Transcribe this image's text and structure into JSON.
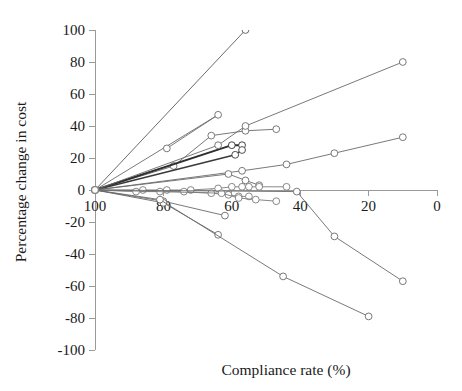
{
  "chart_data": {
    "type": "line",
    "title": "",
    "xlabel": "Compliance rate (%)",
    "ylabel": "Percentage change in cost",
    "xlim": [
      100,
      0
    ],
    "ylim": [
      -100,
      100
    ],
    "x_ticks": [
      100,
      80,
      60,
      40,
      20,
      0
    ],
    "y_ticks": [
      100,
      80,
      60,
      40,
      20,
      0,
      -20,
      -40,
      -60,
      -80,
      -100
    ],
    "x_reversed": true,
    "grid": false,
    "legend": "none",
    "marker": "open-circle",
    "series": [
      {
        "name": "series-1",
        "color": "#5a5a5a",
        "width": 0.9,
        "points": [
          [
            100,
            0
          ],
          [
            56,
            100
          ]
        ]
      },
      {
        "name": "series-2",
        "color": "#6a6a6a",
        "width": 0.9,
        "points": [
          [
            100,
            0
          ],
          [
            64,
            47
          ],
          [
            79,
            26
          ]
        ]
      },
      {
        "name": "series-3",
        "color": "#6a6a6a",
        "width": 0.9,
        "points": [
          [
            100,
            0
          ],
          [
            77,
            15
          ],
          [
            66,
            34
          ],
          [
            56,
            37
          ],
          [
            47,
            38
          ]
        ]
      },
      {
        "name": "series-4",
        "color": "#2e2e2e",
        "width": 1.9,
        "points": [
          [
            100,
            0
          ],
          [
            60,
            28
          ],
          [
            57,
            28
          ]
        ]
      },
      {
        "name": "series-5",
        "color": "#3a3a3a",
        "width": 1.6,
        "points": [
          [
            100,
            0
          ],
          [
            59,
            22
          ],
          [
            57,
            25
          ]
        ]
      },
      {
        "name": "series-6",
        "color": "#6a6a6a",
        "width": 0.9,
        "points": [
          [
            100,
            0
          ],
          [
            64,
            28
          ],
          [
            56,
            40
          ],
          [
            10,
            80
          ]
        ]
      },
      {
        "name": "series-7",
        "color": "#6a6a6a",
        "width": 0.9,
        "points": [
          [
            100,
            0
          ],
          [
            57,
            12
          ],
          [
            44,
            16
          ],
          [
            30,
            23
          ],
          [
            10,
            33
          ]
        ]
      },
      {
        "name": "series-8",
        "color": "#6a6a6a",
        "width": 0.9,
        "points": [
          [
            100,
            0
          ],
          [
            61,
            10
          ],
          [
            56,
            6
          ],
          [
            52,
            3
          ]
        ]
      },
      {
        "name": "series-9",
        "color": "#7a7a7a",
        "width": 0.9,
        "points": [
          [
            100,
            0
          ],
          [
            86,
            0
          ],
          [
            79,
            0
          ],
          [
            72,
            0
          ],
          [
            64,
            1
          ],
          [
            60,
            2
          ],
          [
            57,
            2
          ],
          [
            55,
            2
          ],
          [
            52,
            2
          ],
          [
            44,
            2
          ]
        ]
      },
      {
        "name": "series-10",
        "color": "#7a7a7a",
        "width": 0.9,
        "points": [
          [
            100,
            0
          ],
          [
            88,
            -1
          ],
          [
            81,
            -1
          ],
          [
            74,
            -1
          ],
          [
            66,
            -2
          ],
          [
            61,
            -3
          ],
          [
            58,
            -4
          ],
          [
            55,
            -4
          ]
        ]
      },
      {
        "name": "series-11",
        "color": "#7a7a7a",
        "width": 0.9,
        "points": [
          [
            100,
            0
          ],
          [
            63,
            -2
          ],
          [
            58,
            -5
          ],
          [
            53,
            -6
          ],
          [
            47,
            -7
          ]
        ]
      },
      {
        "name": "series-12",
        "color": "#6a6a6a",
        "width": 0.9,
        "points": [
          [
            100,
            0
          ],
          [
            80,
            -7
          ],
          [
            62,
            -16
          ]
        ]
      },
      {
        "name": "series-13",
        "color": "#6a6a6a",
        "width": 0.9,
        "points": [
          [
            100,
            0
          ],
          [
            80,
            -8
          ],
          [
            64,
            -28
          ]
        ]
      },
      {
        "name": "series-14",
        "color": "#6a6a6a",
        "width": 0.9,
        "points": [
          [
            100,
            0
          ],
          [
            41,
            -1
          ],
          [
            30,
            -29
          ],
          [
            10,
            -57
          ]
        ]
      },
      {
        "name": "series-15",
        "color": "#6a6a6a",
        "width": 0.9,
        "points": [
          [
            100,
            0
          ],
          [
            81,
            -6
          ],
          [
            45,
            -54
          ],
          [
            20,
            -79
          ]
        ]
      }
    ]
  }
}
